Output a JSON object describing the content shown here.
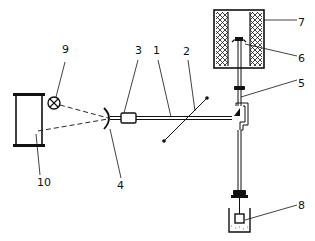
{
  "diagram": {
    "type": "technical-schematic",
    "line_color": "#111111",
    "background": "#ffffff",
    "labels": [
      {
        "id": "1",
        "text": "1"
      },
      {
        "id": "2",
        "text": "2"
      },
      {
        "id": "3",
        "text": "3"
      },
      {
        "id": "4",
        "text": "4"
      },
      {
        "id": "5",
        "text": "5"
      },
      {
        "id": "6",
        "text": "6"
      },
      {
        "id": "7",
        "text": "7"
      },
      {
        "id": "8",
        "text": "8"
      },
      {
        "id": "9",
        "text": "9"
      },
      {
        "id": "10",
        "text": "10"
      }
    ],
    "components": [
      {
        "label": "1",
        "shape": "horizontal-rod"
      },
      {
        "label": "2",
        "shape": "diagonal-line-with-endpoints"
      },
      {
        "label": "3",
        "shape": "small-rectangular-coupling"
      },
      {
        "label": "4",
        "shape": "concave-mirror-arc"
      },
      {
        "label": "5",
        "shape": "vertical-shaft-with-offset-bracket"
      },
      {
        "label": "6",
        "shape": "sample-holder-inside-furnace"
      },
      {
        "label": "7",
        "shape": "cross-hatched-furnace-cylinder"
      },
      {
        "label": "8",
        "shape": "weight-in-liquid-bath"
      },
      {
        "label": "9",
        "shape": "lamp-circle-with-cross"
      },
      {
        "label": "10",
        "shape": "scale-screen"
      }
    ]
  }
}
